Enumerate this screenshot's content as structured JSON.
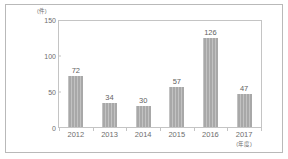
{
  "chart_data": {
    "type": "bar",
    "title": "",
    "subtitle": "",
    "xlabel": "",
    "ylabel": "",
    "unit_label": "(件)",
    "categories": [
      "2012",
      "2013",
      "2014",
      "2015",
      "2016",
      "2017"
    ],
    "values": [
      72,
      34,
      30,
      57,
      126,
      47
    ],
    "data_labels": [
      "72",
      "34",
      "30",
      "57",
      "126",
      "47"
    ],
    "category_note": "(年度)",
    "note_category_index": 5,
    "ylim": [
      0,
      150
    ],
    "yticks": [
      0,
      50,
      100,
      150
    ],
    "ytick_labels": [
      "0",
      "50",
      "100",
      "150"
    ],
    "grid": false,
    "legend": false,
    "legend_position": "none",
    "bar_color": "#a8a8a8",
    "axis_color": "#c4c4c4",
    "text_color": "#6d6d6d",
    "background_color": "#ffffff",
    "frame_color": "#b9b9b9"
  }
}
